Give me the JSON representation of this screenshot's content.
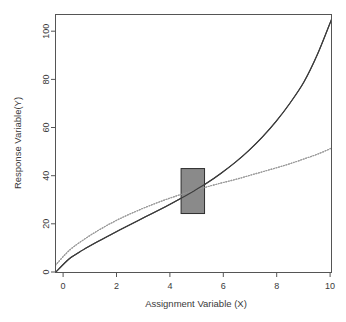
{
  "chart_data": {
    "type": "line",
    "title": "",
    "xlabel": "Assignment Variable (X)",
    "ylabel": "Response Variable(Y)",
    "xlim": [
      0,
      10
    ],
    "ylim": [
      0,
      105
    ],
    "xticks": [
      0,
      2,
      4,
      6,
      8,
      10
    ],
    "yticks": [
      0,
      20,
      40,
      60,
      80,
      100
    ],
    "xtick_labels": [
      "0",
      "2",
      "4",
      "6",
      "8",
      "10"
    ],
    "ytick_labels": [
      "0",
      "20",
      "40",
      "60",
      "80",
      "100"
    ],
    "grid": false,
    "legend": "none",
    "series": [
      {
        "name": "solid-curve",
        "style": "solid",
        "color": "#3c3c3c",
        "x": [
          0,
          0.5,
          1,
          1.5,
          2,
          2.5,
          3,
          3.5,
          4,
          4.5,
          5,
          5.5,
          6,
          6.5,
          7,
          7.5,
          8,
          8.5,
          9,
          9.5,
          10
        ],
        "values": [
          0,
          5.6,
          9.2,
          12.4,
          15.4,
          18.3,
          21.2,
          24.0,
          26.9,
          29.9,
          33.1,
          36.5,
          40.4,
          44.7,
          49.6,
          55.2,
          61.6,
          69.0,
          77.5,
          89.0,
          103.0
        ]
      },
      {
        "name": "dotted-curve",
        "style": "dotted",
        "color": "#9a9a9a",
        "x": [
          0,
          0.5,
          1,
          1.5,
          2,
          2.5,
          3,
          3.5,
          4,
          4.5,
          5,
          5.5,
          6,
          6.5,
          7,
          7.5,
          8,
          8.5,
          9,
          9.5,
          10
        ],
        "values": [
          3.0,
          9.0,
          13.2,
          16.8,
          20.0,
          22.8,
          25.3,
          27.6,
          29.7,
          31.6,
          33.3,
          34.9,
          36.4,
          37.8,
          39.4,
          41.0,
          42.6,
          44.3,
          46.2,
          48.2,
          50.6
        ]
      }
    ],
    "annotations": [
      {
        "name": "bandwidth-region",
        "shape": "rectangle",
        "x0": 4.55,
        "x1": 5.4,
        "y0": 24.0,
        "y1": 42.3,
        "fill": "#8a8a8a",
        "stroke": "#2e2e2e"
      }
    ]
  },
  "colors": {
    "background": "#ffffff",
    "frame": "#555555",
    "text": "#3a3a3a",
    "solid_curve": "#3c3c3c",
    "dotted_curve": "#9a9a9a",
    "region_fill": "#8a8a8a",
    "region_stroke": "#2e2e2e"
  }
}
